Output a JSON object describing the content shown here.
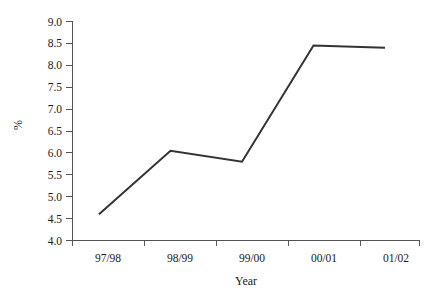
{
  "chart_data": {
    "type": "line",
    "title": "",
    "xlabel": "Year",
    "ylabel": "%",
    "categories": [
      "97/98",
      "98/99",
      "99/00",
      "00/01",
      "01/02"
    ],
    "values": [
      4.6,
      6.05,
      5.8,
      8.45,
      8.4
    ],
    "series": [
      {
        "name": "",
        "values": [
          4.6,
          6.05,
          5.8,
          8.45,
          8.4
        ]
      }
    ],
    "ylim": [
      4.0,
      9.0
    ],
    "ytick_labels": [
      "4.0",
      "4.5",
      "5.0",
      "5.5",
      "6.0",
      "6.5",
      "7.0",
      "7.5",
      "8.0",
      "8.5",
      "9.0"
    ],
    "ytick_values": [
      4.0,
      4.5,
      5.0,
      5.5,
      6.0,
      6.5,
      7.0,
      7.5,
      8.0,
      8.5,
      9.0
    ],
    "grid": false,
    "legend": false,
    "legend_position": "none",
    "line_color": "#333333"
  },
  "axis": {
    "y_title": "%",
    "x_title": "Year"
  },
  "yticks": [
    {
      "label": "9.0"
    },
    {
      "label": "8.5"
    },
    {
      "label": "8.0"
    },
    {
      "label": "7.5"
    },
    {
      "label": "7.0"
    },
    {
      "label": "6.5"
    },
    {
      "label": "6.0"
    },
    {
      "label": "5.5"
    },
    {
      "label": "5.0"
    },
    {
      "label": "4.5"
    },
    {
      "label": "4.0"
    }
  ],
  "xticks": [
    {
      "label": "97/98"
    },
    {
      "label": "98/99"
    },
    {
      "label": "99/00"
    },
    {
      "label": "00/01"
    },
    {
      "label": "01/02"
    }
  ]
}
